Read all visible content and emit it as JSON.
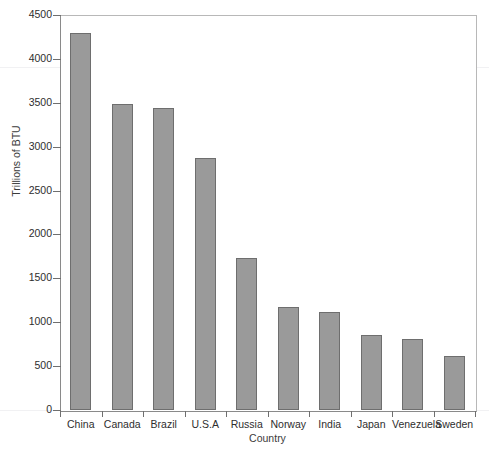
{
  "chart_data": {
    "type": "bar",
    "title": "",
    "xlabel": "Country",
    "ylabel": "Trillions of BTU",
    "categories": [
      "China",
      "Canada",
      "Brazil",
      "U.S.A",
      "Russia",
      "Norway",
      "India",
      "Japan",
      "Venezuela",
      "Sweden"
    ],
    "values": [
      4290,
      3490,
      3440,
      2870,
      1730,
      1170,
      1120,
      860,
      810,
      610
    ],
    "ylim": [
      0,
      4500
    ],
    "ytick_step": 500,
    "yticks": [
      0,
      500,
      1000,
      1500,
      2000,
      2500,
      3000,
      3500,
      4000,
      4500
    ],
    "ytick_labels": [
      "0",
      "500",
      "1000",
      "1500",
      "2000",
      "2500",
      "3000",
      "3500",
      "4000",
      "4500"
    ],
    "grid": false,
    "legend": false,
    "bar_color": "#9a9a9a",
    "bar_border_color": "#6e6e6e",
    "axis_color": "#8a8a8a",
    "text_color": "#2e2e2e"
  },
  "axes": {
    "y_title": "Trillions of BTU",
    "x_title": "Country"
  },
  "title": {
    "text": ""
  }
}
